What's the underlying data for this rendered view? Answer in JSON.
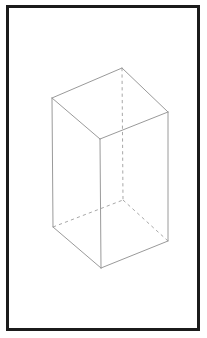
{
  "figure": {
    "shape_name": "rectangular-prism",
    "projection": "isometric-wireframe",
    "canvas": {
      "width": 207,
      "height": 338,
      "background": "#ffffff"
    },
    "frame": {
      "name": "figure-border",
      "x": 6,
      "y": 5,
      "width": 194,
      "height": 326,
      "stroke": "#1b1b1b",
      "stroke_width": 3
    },
    "style": {
      "visible_edge_color": "#9a9a9a",
      "hidden_edge_color": "#a8a8a8",
      "edge_width": 1,
      "face_fill": "#ffffff",
      "hidden_dash_pattern": "3.2 3.2"
    },
    "vertices": {
      "top_left": {
        "x": 52,
        "y": 98
      },
      "top_back": {
        "x": 122,
        "y": 68
      },
      "top_right": {
        "x": 168,
        "y": 112
      },
      "top_front": {
        "x": 100,
        "y": 139
      },
      "bottom_left": {
        "x": 53,
        "y": 227
      },
      "bottom_back": {
        "x": 123,
        "y": 200
      },
      "bottom_right": {
        "x": 168,
        "y": 241
      },
      "bottom_front": {
        "x": 101,
        "y": 268
      }
    },
    "faces": {
      "top": "52,98 122,68 168,112 100,139",
      "left": "52,98 100,139 101,268 53,227",
      "right": "100,139 168,112 168,241 101,268"
    },
    "visible_edges": [
      {
        "name": "top-left-back",
        "points": "52,98 122,68"
      },
      {
        "name": "top-back-right",
        "points": "122,68 168,112"
      },
      {
        "name": "top-right-front",
        "points": "168,112 100,139"
      },
      {
        "name": "top-front-left",
        "points": "100,139 52,98"
      },
      {
        "name": "vertical-left",
        "points": "52,98 53,227"
      },
      {
        "name": "vertical-front",
        "points": "100,139 101,268"
      },
      {
        "name": "vertical-right",
        "points": "168,112 168,241"
      },
      {
        "name": "bottom-left-front",
        "points": "53,227 101,268"
      },
      {
        "name": "bottom-front-right",
        "points": "101,268 168,241"
      }
    ],
    "hidden_edges": [
      {
        "name": "vertical-back-hidden",
        "points": "122,68 123,200"
      },
      {
        "name": "bottom-left-back-hidden",
        "points": "53,227 123,200"
      },
      {
        "name": "bottom-back-right-hidden",
        "points": "123,200 168,241"
      }
    ]
  }
}
